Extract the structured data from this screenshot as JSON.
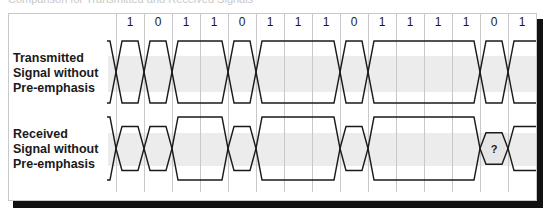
{
  "header": {
    "caption": "Comparison for Transmitted and Received Signals"
  },
  "bits": [
    "1",
    "0",
    "1",
    "1",
    "0",
    "1",
    "1",
    "1",
    "0",
    "1",
    "1",
    "1",
    "1",
    "0",
    "1"
  ],
  "rows": [
    {
      "id": "transmitted",
      "label_lines": [
        "Transmitted",
        "Signal without",
        "Pre-emphasis"
      ],
      "high": 41,
      "low": 103
    },
    {
      "id": "received",
      "label_lines": [
        "Received",
        "Signal without",
        "Pre-emphasis"
      ],
      "high": 117,
      "low": 180
    }
  ],
  "annotations": {
    "unknown_bit_marker": "?"
  },
  "colors": {
    "line": "#1a1a1a",
    "grid": "#c8c8c8",
    "band": "#ececec",
    "eye_fill": "#e6e6e6",
    "shadow": "#111111"
  }
}
